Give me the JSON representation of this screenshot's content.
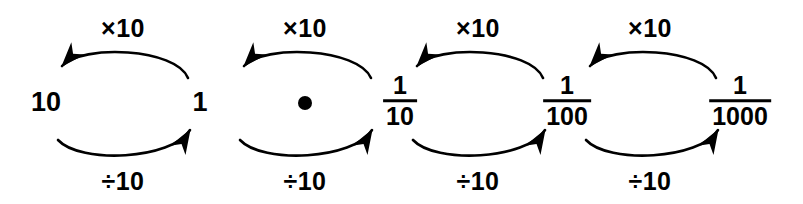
{
  "diagram": {
    "background_color": "#ffffff",
    "stroke_color": "#000000",
    "width": 803,
    "height": 204,
    "nodes": [
      {
        "id": "ten",
        "kind": "plain",
        "text": "10",
        "x": 46,
        "y": 102
      },
      {
        "id": "one",
        "kind": "plain",
        "text": "1",
        "x": 200,
        "y": 102
      },
      {
        "id": "point",
        "kind": "dot",
        "text": "",
        "x": 305,
        "y": 103
      },
      {
        "id": "tenth",
        "kind": "fraction",
        "numerator": "1",
        "denominator": "10",
        "x": 400,
        "y": 101
      },
      {
        "id": "hundredth",
        "kind": "fraction",
        "numerator": "1",
        "denominator": "100",
        "x": 567,
        "y": 101
      },
      {
        "id": "thousandth",
        "kind": "fraction",
        "numerator": "1",
        "denominator": "1000",
        "x": 740,
        "y": 101
      }
    ],
    "cycles": [
      {
        "id": "cycle-1",
        "left_node": "ten",
        "right_node": "one",
        "multiply_label": "×10",
        "divide_label": "÷10",
        "multiply_label_x": 123,
        "multiply_label_y": 28,
        "divide_label_x": 123,
        "divide_label_y": 181
      },
      {
        "id": "cycle-2",
        "left_node": "point",
        "right_node": "tenth",
        "multiply_label": "×10",
        "divide_label": "÷10",
        "multiply_label_x": 305,
        "multiply_label_y": 28,
        "divide_label_x": 305,
        "divide_label_y": 181
      },
      {
        "id": "cycle-3",
        "left_node": "tenth",
        "right_node": "hundredth",
        "multiply_label": "×10",
        "divide_label": "÷10",
        "multiply_label_x": 478,
        "multiply_label_y": 28,
        "divide_label_x": 478,
        "divide_label_y": 181
      },
      {
        "id": "cycle-4",
        "left_node": "hundredth",
        "right_node": "thousandth",
        "multiply_label": "×10",
        "divide_label": "÷10",
        "multiply_label_x": 650,
        "multiply_label_y": 28,
        "divide_label_x": 650,
        "divide_label_y": 181
      }
    ]
  }
}
